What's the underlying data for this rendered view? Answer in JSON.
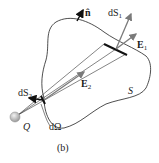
{
  "figure": {
    "caption": "(b)",
    "surface_label": "S",
    "charge_label": "Q",
    "solid_angle_label": "dΩ",
    "normal_label": "n̂",
    "vectors": {
      "dS1": {
        "base": "dS",
        "sub": "1"
      },
      "dS2": {
        "base": "dS",
        "sub": "2"
      },
      "E1": {
        "base": "E",
        "sub": "1"
      },
      "E2": {
        "base": "E",
        "sub": "2"
      }
    }
  },
  "colors": {
    "line": "#222222",
    "arrow_gray": "#7a7a7a",
    "charge": "#bbbbbb"
  }
}
